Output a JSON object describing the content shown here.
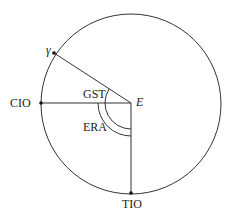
{
  "diagram": {
    "type": "celestial-angle-diagram",
    "circle": {
      "cx": 131,
      "cy": 104,
      "r": 90
    },
    "center": {
      "label": "E",
      "x": 131,
      "y": 103
    },
    "points": [
      {
        "id": "gamma",
        "label": "γ",
        "x": 54,
        "y": 53
      },
      {
        "id": "cio",
        "label": "CIO",
        "x": 41,
        "y": 103
      },
      {
        "id": "tio",
        "label": "TIO",
        "x": 131,
        "y": 193
      }
    ],
    "angles": [
      {
        "id": "gst",
        "label": "GST",
        "from": "gamma",
        "to": "tio",
        "radius": 26
      },
      {
        "id": "era",
        "label": "ERA",
        "from": "cio",
        "to": "tio",
        "radius": 33
      }
    ],
    "colors": {
      "stroke": "#333333",
      "text": "#222222",
      "background": "#ffffff"
    }
  }
}
